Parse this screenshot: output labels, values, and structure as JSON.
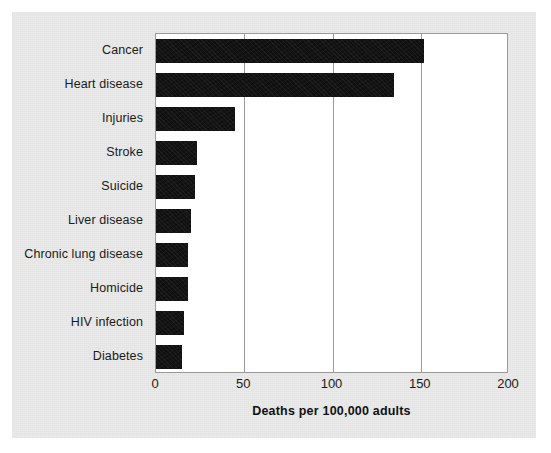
{
  "figure": {
    "background_color": "#eaeaea",
    "page_color": "#ffffff",
    "plot_background": "#ffffff",
    "bar_color": "#101010",
    "grid_color": "#9a9a9a"
  },
  "chart_data": {
    "type": "bar",
    "orientation": "horizontal",
    "title": "",
    "xlabel": "Deaths per 100,000 adults",
    "ylabel": "",
    "xlim": [
      0,
      200
    ],
    "xticks": [
      0,
      50,
      100,
      150,
      200
    ],
    "xtick_labels": [
      "0",
      "50",
      "100",
      "150",
      "200"
    ],
    "grid": "vertical",
    "legend": "none",
    "categories": [
      "Cancer",
      "Heart disease",
      "Injuries",
      "Stroke",
      "Suicide",
      "Liver disease",
      "Chronic lung disease",
      "Homicide",
      "HIV infection",
      "Diabetes"
    ],
    "values": [
      152,
      135,
      45,
      23,
      22,
      20,
      18,
      18,
      16,
      15
    ]
  }
}
